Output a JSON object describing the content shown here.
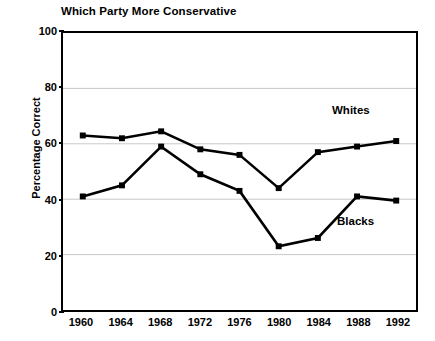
{
  "chart_data": {
    "type": "line",
    "title": "Which Party More Conservative",
    "xlabel": "",
    "ylabel": "Percentage Correct",
    "categories": [
      "1960",
      "1964",
      "1968",
      "1972",
      "1976",
      "1980",
      "1984",
      "1988",
      "1992"
    ],
    "x": [
      1960,
      1964,
      1968,
      1972,
      1976,
      1980,
      1984,
      1988,
      1992
    ],
    "ylim": [
      0,
      100
    ],
    "yticks": [
      0,
      20,
      40,
      60,
      80,
      100
    ],
    "ytick_labels": [
      "0",
      "20",
      "40",
      "60",
      "80",
      "100"
    ],
    "grid": true,
    "grid_axis": "y",
    "legend": "inline-annotations",
    "series": [
      {
        "name": "Whites",
        "color": "#000000",
        "marker": "square",
        "values": [
          63,
          62,
          64.5,
          58,
          56,
          44,
          57,
          59,
          61
        ]
      },
      {
        "name": "Blacks",
        "color": "#000000",
        "marker": "square",
        "values": [
          41,
          45,
          59,
          49,
          43,
          23,
          26,
          41,
          39.5
        ]
      }
    ],
    "annotations": [
      {
        "text": "Whites",
        "series": "Whites"
      },
      {
        "text": "Blacks",
        "series": "Blacks"
      }
    ]
  },
  "style": {
    "background": "#ffffff",
    "axis_color": "#000000",
    "grid_color": "#c8c8c8",
    "line_color": "#000000"
  }
}
